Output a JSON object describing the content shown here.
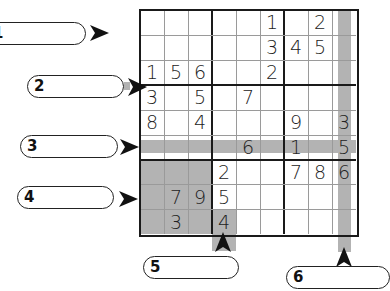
{
  "puzzle": {
    "type": "sudoku",
    "grid": [
      [
        "",
        "",
        "",
        "",
        "",
        "1",
        "",
        "2",
        ""
      ],
      [
        "",
        "",
        "",
        "",
        "",
        "3",
        "4",
        "5",
        ""
      ],
      [
        "1",
        "5",
        "6",
        "",
        "",
        "2",
        "",
        "",
        ""
      ],
      [
        "3",
        "",
        "5",
        "",
        "7",
        "",
        "",
        "",
        ""
      ],
      [
        "8",
        "",
        "4",
        "",
        "",
        "",
        "9",
        "",
        "3"
      ],
      [
        "",
        "",
        "",
        "",
        "6",
        "",
        "1",
        "",
        "5"
      ],
      [
        "",
        "",
        "",
        "2",
        "",
        "",
        "7",
        "8",
        "6"
      ],
      [
        "",
        "7",
        "9",
        "5",
        "",
        "",
        "",
        "",
        ""
      ],
      [
        "",
        "3",
        "",
        "4",
        "",
        "",
        "",
        "",
        ""
      ]
    ],
    "highlights": {
      "row_band": "row 6",
      "column_band": "column 9",
      "box": "box 7 (rows 7-9, cols 1-3)",
      "cell": "r9c4"
    },
    "shade_color": "#b3b3b3"
  },
  "callouts": [
    {
      "label": "1",
      "points_to": "row 1",
      "direction": "right"
    },
    {
      "label": "2",
      "points_to": "line between row 3 and row 4",
      "direction": "right"
    },
    {
      "label": "3",
      "points_to": "row 6",
      "direction": "right"
    },
    {
      "label": "4",
      "points_to": "row 8",
      "direction": "right"
    },
    {
      "label": "5",
      "points_to": "column 4",
      "direction": "up"
    },
    {
      "label": "6",
      "points_to": "column 9",
      "direction": "up"
    }
  ]
}
